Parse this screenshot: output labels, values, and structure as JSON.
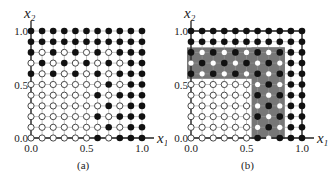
{
  "figure": {
    "panels": [
      {
        "id": "a",
        "caption": "(a)",
        "x_axis_label": "x1",
        "y_axis_label": "x2",
        "x_ticks": [
          "0.0",
          "0.5",
          "1.0"
        ],
        "y_ticks": [
          "0.0",
          "0.5",
          "1.0"
        ],
        "shaded_region": false,
        "outer_box": false
      },
      {
        "id": "b",
        "caption": "(b)",
        "x_axis_label": "x1",
        "y_axis_label": "x2",
        "x_ticks": [
          "0.0",
          "0.5",
          "1.0"
        ],
        "y_ticks": [
          "0.0",
          "0.5",
          "1.0"
        ],
        "shaded_region": true,
        "shaded_region_description": "L-shaped gray region covering rows x2=0.6..0.8 for x1=0.0..0.8 and columns x1=0.6..0.8 for x2=0.0..0.5",
        "outer_box": true
      }
    ],
    "grid": {
      "x_values": [
        0.0,
        0.1,
        0.2,
        0.3,
        0.4,
        0.5,
        0.6,
        0.7,
        0.8,
        0.9,
        1.0
      ],
      "y_values_top_to_bottom": [
        1.0,
        0.9,
        0.8,
        0.7,
        0.6,
        0.5,
        0.4,
        0.3,
        0.2,
        0.1,
        0.0
      ],
      "legend": {
        "F": "filled (black) dot",
        "O": "open (white) dot"
      },
      "rows_top_to_bottom": [
        "FFFFFFFFFFF",
        "FFFFFFFFFFF",
        "FOFOFOFOFFF",
        "OFOFOFOFOFF",
        "FOFOFOFOFFF",
        "OOOOOOOFOFF",
        "OOOOOOFOFFF",
        "OOOOOOOFOFF",
        "OOOOOOFOFFF",
        "OOOOOOOFOFF",
        "OOOOOOFOFFF"
      ]
    },
    "colors": {
      "dot_filled": "#111111",
      "dot_open_fill": "#ffffff",
      "line": "#333333",
      "shade": "#777777"
    }
  }
}
